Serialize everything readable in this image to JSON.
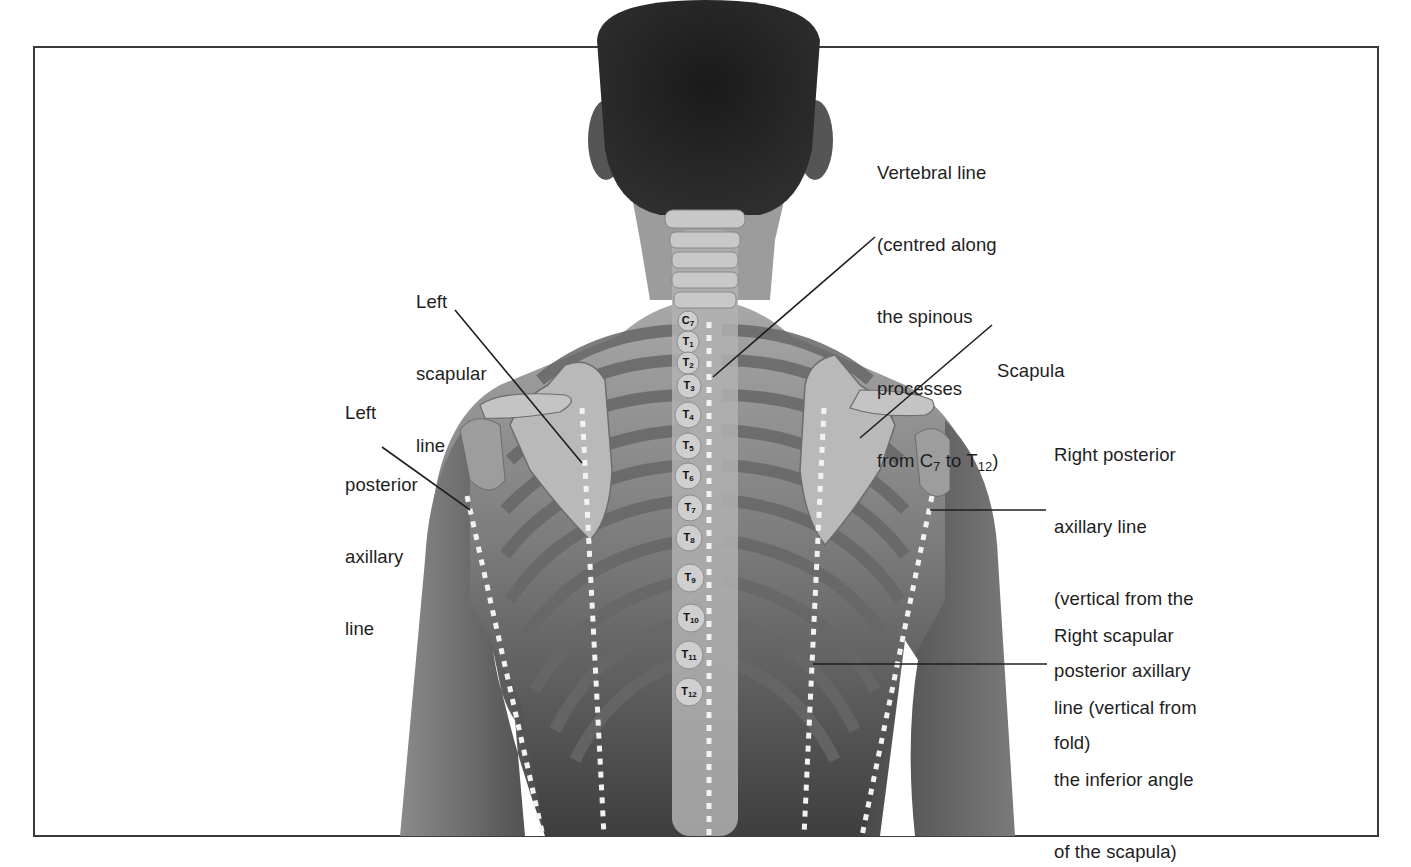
{
  "figure": {
    "colors": {
      "frame": "#3a3a3a",
      "text": "#1e1e1e",
      "skin_light": "#9a9a9a",
      "skin_dark": "#4a4a4a",
      "bone": "#bdbdbd",
      "rib_band": "#6b6b6b",
      "dotted_line": "#f2f2f2",
      "hair": "#141414"
    }
  },
  "labels": {
    "vertebral_line": {
      "lines": [
        "Vertebral line",
        "(centred along",
        "the spinous",
        "processes"
      ],
      "last_prefix": "from C",
      "last_sub1": "7",
      "last_mid": " to T",
      "last_sub2": "12",
      "last_suffix": ")"
    },
    "left_scapular_line": {
      "lines": [
        "Left",
        "scapular",
        "line"
      ]
    },
    "left_posterior_axillary_line": {
      "lines": [
        "Left",
        "posterior",
        "axillary",
        "line"
      ]
    },
    "scapula": {
      "lines": [
        "Scapula"
      ]
    },
    "right_posterior_axillary_line": {
      "lines": [
        "Right posterior",
        "axillary line",
        "(vertical from the",
        "posterior axillary",
        "fold)"
      ]
    },
    "right_scapular_line": {
      "lines": [
        "Right scapular",
        "line (vertical from",
        "the inferior angle",
        "of the scapula)"
      ]
    }
  },
  "vertebrae": [
    {
      "letter": "C",
      "num": "7",
      "x": 688,
      "y": 321
    },
    {
      "letter": "T",
      "num": "1",
      "x": 688,
      "y": 342
    },
    {
      "letter": "T",
      "num": "2",
      "x": 688,
      "y": 363
    },
    {
      "letter": "T",
      "num": "3",
      "x": 689,
      "y": 386
    },
    {
      "letter": "T",
      "num": "4",
      "x": 688,
      "y": 415
    },
    {
      "letter": "T",
      "num": "5",
      "x": 688,
      "y": 446
    },
    {
      "letter": "T",
      "num": "6",
      "x": 688,
      "y": 476
    },
    {
      "letter": "T",
      "num": "7",
      "x": 690,
      "y": 508
    },
    {
      "letter": "T",
      "num": "8",
      "x": 689,
      "y": 538
    },
    {
      "letter": "T",
      "num": "9",
      "x": 690,
      "y": 578
    },
    {
      "letter": "T",
      "num": "10",
      "x": 691,
      "y": 618
    },
    {
      "letter": "T",
      "num": "11",
      "x": 689,
      "y": 655
    },
    {
      "letter": "T",
      "num": "12",
      "x": 689,
      "y": 692
    }
  ]
}
